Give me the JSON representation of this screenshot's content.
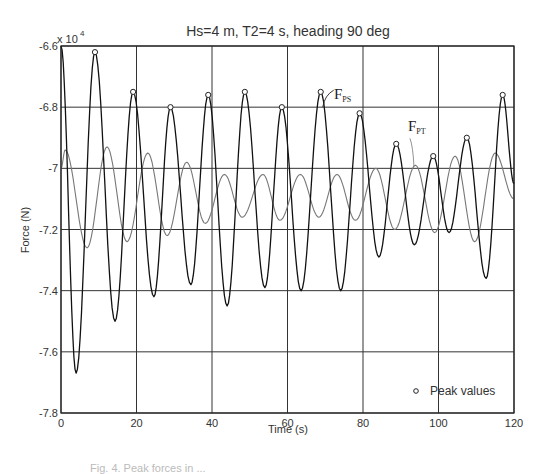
{
  "chart_data": {
    "type": "line",
    "title": "Hs=4 m, T2=4 s, heading 90 deg",
    "xlabel": "Time (s)",
    "ylabel": "Force (N)",
    "y_multiplier_label": "x 10",
    "y_multiplier_exponent": "4",
    "xlim": [
      0,
      120
    ],
    "ylim": [
      -7.8,
      -6.6
    ],
    "xticks": [
      0,
      20,
      40,
      60,
      80,
      100,
      120
    ],
    "xtick_labels": [
      "0",
      "20",
      "40",
      "60",
      "80",
      "100",
      "120"
    ],
    "yticks": [
      -6.6,
      -6.8,
      -7.0,
      -7.2,
      -7.4,
      -7.6,
      -7.8
    ],
    "ytick_labels": [
      "-6.6",
      "-6.8",
      "-7",
      "-7.2",
      "-7.4",
      "-7.6",
      "-7.8"
    ],
    "grid": true,
    "series": [
      {
        "name": "F_PS",
        "label_main": "F",
        "label_sub": "PS",
        "color": "#111111",
        "x": [
          0,
          4.0,
          9.0,
          14.3,
          19.1,
          24.6,
          29.0,
          34.4,
          39.0,
          44.0,
          48.7,
          54.0,
          58.5,
          63.6,
          68.8,
          74.1,
          79.1,
          84.2,
          88.8,
          93.6,
          98.6,
          102.8,
          107.5,
          112.6,
          117.0,
          120
        ],
        "values": [
          -6.6,
          -7.67,
          -6.62,
          -7.5,
          -6.75,
          -7.42,
          -6.8,
          -7.38,
          -6.76,
          -7.45,
          -6.75,
          -7.39,
          -6.8,
          -7.4,
          -6.75,
          -7.4,
          -6.82,
          -7.29,
          -6.92,
          -7.25,
          -6.96,
          -7.21,
          -6.9,
          -7.36,
          -6.76,
          -7.05
        ]
      },
      {
        "name": "F_PT",
        "label_main": "F",
        "label_sub": "PT",
        "color": "#777777",
        "x": [
          0,
          1.1,
          6.9,
          12.2,
          17.5,
          23.0,
          28.1,
          33.3,
          38.2,
          43.3,
          48.0,
          53.5,
          58.0,
          63.4,
          68.3,
          73.1,
          78.0,
          83.4,
          88.4,
          93.9,
          99.0,
          104.4,
          109.6,
          115.0,
          120
        ],
        "values": [
          -7.0,
          -6.94,
          -7.26,
          -6.93,
          -7.24,
          -6.95,
          -7.22,
          -6.98,
          -7.18,
          -7.02,
          -7.16,
          -7.02,
          -7.17,
          -7.02,
          -7.16,
          -7.02,
          -7.17,
          -7.0,
          -7.2,
          -6.99,
          -7.21,
          -6.96,
          -7.24,
          -6.95,
          -7.1
        ]
      }
    ],
    "peaks": {
      "name": "Peak values",
      "x": [
        9.0,
        19.1,
        29.0,
        39.0,
        48.7,
        58.5,
        68.8,
        79.1,
        88.8,
        98.6,
        107.5,
        117.0
      ],
      "values": [
        -6.62,
        -6.75,
        -6.8,
        -6.76,
        -6.75,
        -6.8,
        -6.75,
        -6.82,
        -6.92,
        -6.96,
        -6.9,
        -6.76
      ]
    },
    "legend": {
      "position": "bottom-right",
      "entries": [
        "Peak values"
      ]
    },
    "annotations": [
      {
        "text": "F_PS",
        "near_series": "F_PS",
        "at_x": 68.8
      },
      {
        "text": "F_PT",
        "near_series": "F_PT",
        "at_x": 92
      }
    ]
  },
  "caption": "Fig. 4. Peak forces in ..."
}
